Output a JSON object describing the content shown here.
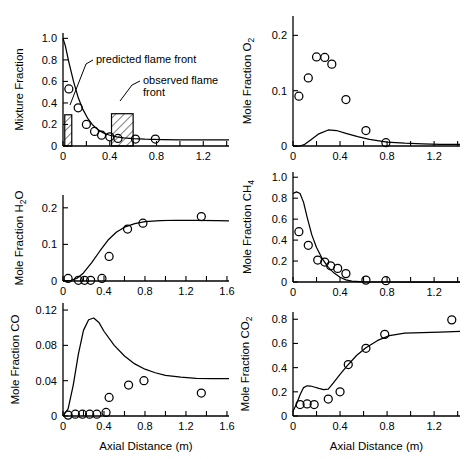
{
  "figure": {
    "name": "combustion-species-profiles",
    "n_panels": 6,
    "shared_xlabel": "Axial Distance (m)",
    "bottom_caption": ""
  },
  "annotations": {
    "predicted_flame_front": "predicted flame front",
    "observed_flame_front_line1": "observed flame",
    "observed_flame_front_line2": "front"
  },
  "chart_data": [
    {
      "id": "mixture-fraction",
      "type": "line",
      "title": "",
      "xlabel": "",
      "ylabel": "Mixture Fraction",
      "xlim": [
        0,
        1.42
      ],
      "ylim": [
        0,
        1.05
      ],
      "xticks": [
        0,
        0.2,
        0.4,
        0.6,
        0.8,
        1.0,
        1.2,
        1.4
      ],
      "xticklabels": [
        "0",
        "",
        "0.4",
        "",
        "0.8",
        "",
        "1.2",
        ""
      ],
      "yticks": [
        0,
        0.2,
        0.4,
        0.6,
        0.8,
        1.0
      ],
      "yticklabels": [
        "0",
        "0.2",
        "0.4",
        "0.6",
        "0.8",
        "1.0"
      ],
      "grid": false,
      "series": [
        {
          "name": "predicted",
          "style": "line",
          "x": [
            0.0,
            0.02,
            0.05,
            0.09,
            0.13,
            0.17,
            0.21,
            0.25,
            0.3,
            0.35,
            0.4,
            0.46,
            0.52,
            0.6,
            0.7,
            0.85,
            1.0,
            1.2,
            1.42
          ],
          "y": [
            1.0,
            0.93,
            0.78,
            0.6,
            0.45,
            0.34,
            0.26,
            0.2,
            0.15,
            0.12,
            0.1,
            0.085,
            0.075,
            0.068,
            0.063,
            0.06,
            0.058,
            0.057,
            0.056
          ]
        },
        {
          "name": "measured",
          "style": "open-circle",
          "x": [
            0.05,
            0.13,
            0.2,
            0.27,
            0.33,
            0.4,
            0.47,
            0.62,
            0.79
          ],
          "y": [
            0.53,
            0.355,
            0.2,
            0.135,
            0.1,
            0.085,
            0.07,
            0.065,
            0.065
          ]
        }
      ],
      "boxes": [
        {
          "name": "predicted-flame-front-box",
          "x0": 0.015,
          "x1": 0.075,
          "y0": 0.0,
          "y1": 0.29
        },
        {
          "name": "observed-flame-front-box",
          "x0": 0.415,
          "x1": 0.6,
          "y0": 0.0,
          "y1": 0.3
        }
      ]
    },
    {
      "id": "mole-fraction-o2",
      "type": "line",
      "title": "",
      "xlabel": "",
      "ylabel": "Mole Fraction O2",
      "ylabel_sub": "2",
      "ylabel_base": "Mole Fraction O",
      "xlim": [
        0,
        1.42
      ],
      "ylim": [
        0,
        0.235
      ],
      "xticks": [
        0,
        0.2,
        0.4,
        0.6,
        0.8,
        1.0,
        1.2,
        1.4
      ],
      "xticklabels": [
        "0",
        "",
        "0.4",
        "",
        "0.8",
        "",
        "1.2",
        ""
      ],
      "yticks": [
        0,
        0.1,
        0.2
      ],
      "yticklabels": [
        "0",
        "0.1",
        "0.2"
      ],
      "grid": false,
      "series": [
        {
          "name": "predicted",
          "style": "line",
          "x": [
            0.0,
            0.06,
            0.1,
            0.15,
            0.22,
            0.3,
            0.37,
            0.45,
            0.55,
            0.65,
            0.8,
            0.95,
            1.1,
            1.25,
            1.42
          ],
          "y": [
            0.0,
            0.0,
            0.003,
            0.011,
            0.022,
            0.029,
            0.028,
            0.023,
            0.017,
            0.012,
            0.007,
            0.005,
            0.004,
            0.003,
            0.003
          ]
        },
        {
          "name": "measured",
          "style": "open-circle",
          "x": [
            0.05,
            0.13,
            0.2,
            0.27,
            0.33,
            0.45,
            0.62,
            0.79
          ],
          "y": [
            0.09,
            0.123,
            0.161,
            0.16,
            0.148,
            0.084,
            0.028,
            0.006
          ]
        }
      ],
      "boxes": []
    },
    {
      "id": "mole-fraction-h2o",
      "type": "line",
      "title": "",
      "xlabel": "",
      "ylabel_base": "Mole Fraction H",
      "ylabel_sub": "2",
      "ylabel_tail": "O",
      "ylabel": "Mole Fraction H2O",
      "xlim": [
        0,
        1.62
      ],
      "ylim": [
        0,
        0.235
      ],
      "xticks": [
        0,
        0.2,
        0.4,
        0.6,
        0.8,
        1.0,
        1.2,
        1.4,
        1.6
      ],
      "xticklabels": [
        "0",
        "",
        "0.4",
        "",
        "0.8",
        "",
        "1.2",
        "",
        "1.6"
      ],
      "yticks": [
        0,
        0.1,
        0.2
      ],
      "yticklabels": [
        "0",
        "0.1",
        "0.2"
      ],
      "grid": false,
      "series": [
        {
          "name": "predicted",
          "style": "line",
          "x": [
            0.0,
            0.08,
            0.14,
            0.2,
            0.28,
            0.36,
            0.44,
            0.52,
            0.6,
            0.7,
            0.8,
            0.95,
            1.1,
            1.3,
            1.5,
            1.62
          ],
          "y": [
            0.0,
            0.002,
            0.008,
            0.022,
            0.05,
            0.082,
            0.112,
            0.133,
            0.147,
            0.157,
            0.162,
            0.165,
            0.166,
            0.166,
            0.165,
            0.164
          ]
        },
        {
          "name": "measured",
          "style": "open-circle",
          "x": [
            0.05,
            0.15,
            0.21,
            0.27,
            0.38,
            0.45,
            0.63,
            0.78,
            1.35
          ],
          "y": [
            0.007,
            0.002,
            0.002,
            0.002,
            0.007,
            0.067,
            0.142,
            0.158,
            0.176
          ]
        }
      ],
      "boxes": []
    },
    {
      "id": "mole-fraction-ch4",
      "type": "line",
      "title": "",
      "xlabel": "",
      "ylabel_base": "Mole Fraction CH",
      "ylabel_sub": "4",
      "ylabel": "Mole Fraction CH4",
      "xlim": [
        0,
        1.42
      ],
      "ylim": [
        0,
        1.05
      ],
      "xticks": [
        0,
        0.2,
        0.4,
        0.6,
        0.8,
        1.0,
        1.2,
        1.4
      ],
      "xticklabels": [
        "0",
        "",
        "0.4",
        "",
        "0.8",
        "",
        "1.2",
        ""
      ],
      "yticks": [
        0,
        0.2,
        0.4,
        0.6,
        0.8,
        1.0
      ],
      "yticklabels": [
        "0",
        "0.2",
        "0.4",
        "0.6",
        "0.8",
        "1.0"
      ],
      "grid": false,
      "series": [
        {
          "name": "predicted",
          "style": "line",
          "x": [
            0.0,
            0.03,
            0.06,
            0.09,
            0.12,
            0.16,
            0.2,
            0.25,
            0.3,
            0.35,
            0.4,
            0.45,
            0.5,
            0.6,
            0.8,
            1.0,
            1.2,
            1.42
          ],
          "y": [
            0.845,
            0.86,
            0.845,
            0.76,
            0.62,
            0.45,
            0.33,
            0.22,
            0.14,
            0.085,
            0.045,
            0.02,
            0.008,
            0.002,
            0.0,
            0.0,
            0.0,
            0.0
          ]
        },
        {
          "name": "measured",
          "style": "open-circle",
          "x": [
            0.05,
            0.13,
            0.21,
            0.27,
            0.32,
            0.38,
            0.45,
            0.62,
            0.79
          ],
          "y": [
            0.48,
            0.35,
            0.21,
            0.19,
            0.155,
            0.13,
            0.08,
            0.018,
            0.012
          ]
        }
      ],
      "boxes": []
    },
    {
      "id": "mole-fraction-co",
      "type": "line",
      "title": "",
      "xlabel": "Axial Distance (m)",
      "ylabel": "Mole Fraction CO",
      "xlim": [
        0,
        1.62
      ],
      "ylim": [
        0,
        0.128
      ],
      "xticks": [
        0,
        0.2,
        0.4,
        0.6,
        0.8,
        1.0,
        1.2,
        1.4,
        1.6
      ],
      "xticklabels": [
        "0",
        "",
        "0.4",
        "",
        "0.8",
        "",
        "1.2",
        "",
        "1.6"
      ],
      "yticks": [
        0,
        0.04,
        0.08,
        0.12
      ],
      "yticklabels": [
        "0",
        "0.04",
        "0.08",
        "0.12"
      ],
      "grid": false,
      "series": [
        {
          "name": "predicted",
          "style": "line",
          "x": [
            0.0,
            0.05,
            0.1,
            0.15,
            0.2,
            0.25,
            0.3,
            0.35,
            0.4,
            0.5,
            0.6,
            0.7,
            0.8,
            0.9,
            1.0,
            1.15,
            1.3,
            1.45,
            1.62
          ],
          "y": [
            0.0,
            0.008,
            0.035,
            0.07,
            0.097,
            0.109,
            0.111,
            0.106,
            0.096,
            0.08,
            0.068,
            0.059,
            0.053,
            0.049,
            0.046,
            0.044,
            0.0425,
            0.0423,
            0.0423
          ]
        },
        {
          "name": "measured",
          "style": "open-circle",
          "x": [
            0.05,
            0.12,
            0.19,
            0.26,
            0.33,
            0.42,
            0.45,
            0.64,
            0.79,
            1.35
          ],
          "y": [
            0.001,
            0.002,
            0.002,
            0.002,
            0.002,
            0.004,
            0.021,
            0.035,
            0.04,
            0.026
          ]
        }
      ],
      "boxes": []
    },
    {
      "id": "mole-fraction-co2",
      "type": "line",
      "title": "",
      "xlabel": "Axial Distance (m)",
      "ylabel_base": "Mole Fraction CO",
      "ylabel_sub": "2",
      "ylabel": "Mole Fraction CO2",
      "xlim": [
        0,
        1.42
      ],
      "ylim": [
        0,
        0.86
      ],
      "xticks": [
        0,
        0.2,
        0.4,
        0.6,
        0.8,
        1.0,
        1.2,
        1.4
      ],
      "xticklabels": [
        "0",
        "",
        "0.4",
        "",
        "0.8",
        "",
        "1.2",
        ""
      ],
      "yticks": [
        0,
        0.2,
        0.4,
        0.6,
        0.8
      ],
      "yticklabels": [
        "0",
        "0.2",
        "0.4",
        "0.6",
        "0.8"
      ],
      "grid": false,
      "series": [
        {
          "name": "predicted",
          "style": "line",
          "x": [
            0.0,
            0.03,
            0.06,
            0.09,
            0.12,
            0.15,
            0.18,
            0.22,
            0.26,
            0.3,
            0.34,
            0.4,
            0.46,
            0.54,
            0.62,
            0.72,
            0.82,
            0.95,
            1.1,
            1.25,
            1.42
          ],
          "y": [
            0.04,
            0.1,
            0.175,
            0.235,
            0.25,
            0.248,
            0.24,
            0.228,
            0.218,
            0.222,
            0.27,
            0.345,
            0.415,
            0.5,
            0.565,
            0.625,
            0.665,
            0.685,
            0.69,
            0.693,
            0.7
          ]
        },
        {
          "name": "measured",
          "style": "open-circle",
          "x": [
            0.06,
            0.12,
            0.18,
            0.3,
            0.4,
            0.47,
            0.62,
            0.78,
            1.35
          ],
          "y": [
            0.095,
            0.1,
            0.095,
            0.14,
            0.2,
            0.425,
            0.56,
            0.675,
            0.795
          ]
        }
      ],
      "boxes": []
    }
  ]
}
